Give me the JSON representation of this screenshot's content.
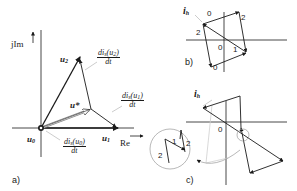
{
  "panel_a": {
    "caption": "a)",
    "axis_imag": "jIm",
    "axis_real": "Re",
    "vectors": {
      "u0": {
        "name": "u",
        "sub": "0"
      },
      "u1": {
        "name": "u",
        "sub": "1"
      },
      "u2": {
        "name": "u",
        "sub": "2"
      },
      "ustar": {
        "name": "u*"
      }
    },
    "derivatives": {
      "d_u2": {
        "num_pre": "di",
        "num_sub": "s",
        "num_arg": "(u",
        "num_arg_sub": "2",
        "num_post": ")",
        "den": "dt"
      },
      "d_u1": {
        "num_pre": "di",
        "num_sub": "s",
        "num_arg": "(u",
        "num_arg_sub": "1",
        "num_post": ")",
        "den": "dt"
      },
      "d_u0": {
        "num_pre": "di",
        "num_sub": "s",
        "num_arg": "(u",
        "num_arg_sub": "0",
        "num_post": ")",
        "den": "dt"
      }
    }
  },
  "panel_b": {
    "caption": "b)",
    "current_label": {
      "name": "i",
      "sub": "h"
    },
    "segment_labels": [
      "0",
      "2",
      "2",
      "0",
      "1",
      "0"
    ]
  },
  "panel_c": {
    "caption": "c)",
    "current_label": {
      "name": "i",
      "sub": "h"
    },
    "origin_label": "0",
    "inset_labels": [
      "1",
      "2",
      "2"
    ]
  },
  "colors": {
    "line": "#1a1a1a",
    "light": "#b0b0b0"
  }
}
